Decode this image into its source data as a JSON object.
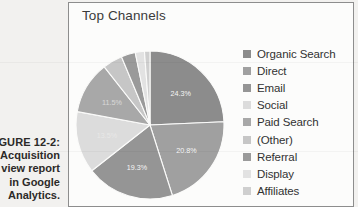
{
  "caption": {
    "figure_number": "IGURE 12-2:",
    "lines": [
      "Acquisition",
      "view report",
      "in Google",
      "Analytics."
    ]
  },
  "panel": {
    "title": "Top Channels"
  },
  "legend": {
    "items": [
      {
        "label": "Organic Search",
        "color": "#8c8c8c"
      },
      {
        "label": "Direct",
        "color": "#a0a0a0"
      },
      {
        "label": "Email",
        "color": "#959595"
      },
      {
        "label": "Social",
        "color": "#dcdcdc"
      },
      {
        "label": "Paid Search",
        "color": "#a8a8a8"
      },
      {
        "label": "(Other)",
        "color": "#c6c6c6"
      },
      {
        "label": "Referral",
        "color": "#9a9a9a"
      },
      {
        "label": "Display",
        "color": "#e2e2e2"
      },
      {
        "label": "Affiliates",
        "color": "#cfcfcf"
      }
    ]
  },
  "chart_data": {
    "type": "pie",
    "title": "Top Channels",
    "categories": [
      "Organic Search",
      "Direct",
      "Email",
      "Social",
      "Paid Search",
      "(Other)",
      "Referral",
      "Display",
      "Affiliates"
    ],
    "values": [
      24.3,
      20.8,
      19.3,
      13.5,
      11.5,
      4.3,
      3.1,
      2.0,
      1.2
    ],
    "unit": "%",
    "labels": [
      "24.3%",
      "20.8%",
      "19.3%",
      "13.5%",
      "11.5%",
      "",
      "",
      "",
      ""
    ],
    "colors": [
      "#8c8c8c",
      "#a0a0a0",
      "#959595",
      "#dcdcdc",
      "#a8a8a8",
      "#c6c6c6",
      "#9a9a9a",
      "#e2e2e2",
      "#cfcfcf"
    ],
    "legend_position": "right",
    "grid": false,
    "start_angle_deg": -90,
    "direction": "clockwise",
    "slice_labels_visible": [
      "24.3%",
      "20.8%",
      "19.3%",
      "13.5%",
      "11.5%"
    ]
  }
}
